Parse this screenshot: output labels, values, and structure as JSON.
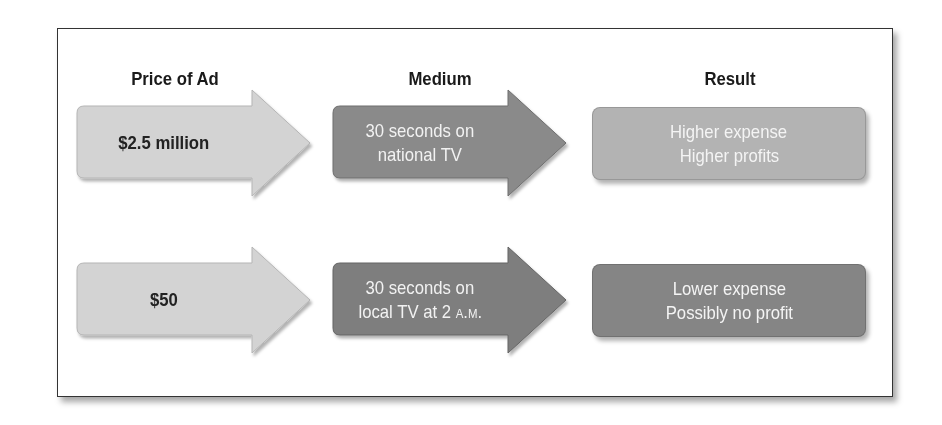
{
  "headers": {
    "price": "Price of Ad",
    "medium": "Medium",
    "result": "Result"
  },
  "colors": {
    "price_arrow": "#d3d3d3",
    "medium_arrow": "#8a8a8a",
    "result_high": "#b3b3b3",
    "result_low": "#858585",
    "frame_border": "#333333"
  },
  "rows": [
    {
      "price": "$2.5 million",
      "medium_line1": "30 seconds on",
      "medium_line2": "national TV",
      "result_line1": "Higher expense",
      "result_line2": "Higher profits"
    },
    {
      "price": "$50",
      "medium_line1": "30 seconds on",
      "medium_line2_prefix": "local TV at 2 ",
      "medium_line2_smallcaps": "a.m.",
      "result_line1": "Lower expense",
      "result_line2": "Possibly no profit"
    }
  ]
}
